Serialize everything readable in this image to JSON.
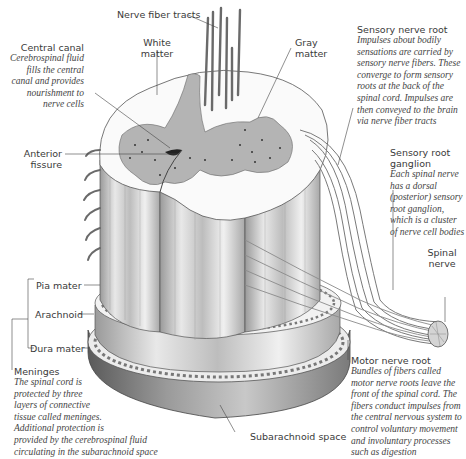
{
  "figure": {
    "background": "#ffffff",
    "ink_color": "#3a3a3a"
  },
  "labels": {
    "nerve_fiber_tracts": {
      "title": "Nerve fiber tracts"
    },
    "white_matter": {
      "title_line1": "White",
      "title_line2": "matter"
    },
    "gray_matter": {
      "title_line1": "Gray",
      "title_line2": "matter"
    },
    "central_canal": {
      "title": "Central canal",
      "desc": [
        "Cerebrospinal fluid",
        "fills the central",
        "canal and provides",
        "nourishment to",
        "nerve cells"
      ]
    },
    "sensory_nerve_root": {
      "title": "Sensory nerve root",
      "desc": [
        "Impulses about bodily",
        "sensations are carried by",
        "sensory nerve fibers. These",
        "converge to form sensory",
        "roots at the back of the",
        "spinal cord. Impulses are",
        "then conveyed to the brain",
        "via nerve fiber tracts"
      ]
    },
    "anterior_fissure": {
      "title_line1": "Anterior",
      "title_line2": "fissure"
    },
    "sensory_root_ganglion": {
      "title_line1": "Sensory root",
      "title_line2": "ganglion",
      "desc": [
        "Each spinal nerve",
        "has a dorsal",
        "(posterior) sensory",
        "root ganglion,",
        "which is a cluster",
        "of nerve cell bodies"
      ]
    },
    "spinal_nerve": {
      "title_line1": "Spinal",
      "title_line2": "nerve"
    },
    "pia_mater": {
      "title": "Pia mater"
    },
    "arachnoid": {
      "title": "Arachnoid"
    },
    "dura_mater": {
      "title": "Dura mater"
    },
    "meninges": {
      "title": "Meninges",
      "desc": [
        "The spinal cord is",
        "protected by three",
        "layers of connective",
        "tissue called meninges.",
        "Additional protection is",
        "provided by the cerebrospinal fluid",
        "circulating in the subarachnoid space"
      ]
    },
    "subarachnoid_space": {
      "title": "Subarachnoid space"
    },
    "motor_nerve_root": {
      "title": "Motor nerve root",
      "desc": [
        "Bundles of fibers called",
        "motor nerve roots leave the",
        "front of the spinal cord. The",
        "fibers conduct impulses from",
        "the central nervous system to",
        "control voluntary movement",
        "and involuntary processes",
        "such as digestion"
      ]
    }
  }
}
